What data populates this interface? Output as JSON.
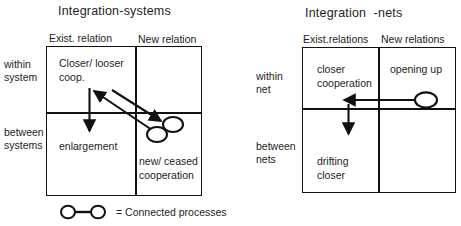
{
  "diagrams": [
    {
      "id": "integration-systems",
      "title": "Integration-systems",
      "columns": [
        "Exist. relation",
        "New relation"
      ],
      "rows": [
        "within\nsystem",
        "between\nsystems"
      ],
      "cells": [
        {
          "row": 0,
          "col": 0,
          "text": "Closer/ looser\ncoop."
        },
        {
          "row": 0,
          "col": 1,
          "text": ""
        },
        {
          "row": 1,
          "col": 0,
          "text": "enlargement"
        },
        {
          "row": 1,
          "col": 1,
          "text": "new/ ceased\ncooperation"
        }
      ]
    },
    {
      "id": "integration-nets",
      "title": "Integration  -nets",
      "columns": [
        "Exist.relations",
        "New relations"
      ],
      "rows": [
        "within\nnet",
        "between\nnets"
      ],
      "cells": [
        {
          "row": 0,
          "col": 0,
          "text": "closer\ncooperation"
        },
        {
          "row": 0,
          "col": 1,
          "text": "opening up"
        },
        {
          "row": 1,
          "col": 0,
          "text": "drifting\ncloser"
        },
        {
          "row": 1,
          "col": 1,
          "text": ""
        }
      ]
    }
  ],
  "legend": {
    "symbol": "connected-processes-symbol",
    "text": "= Connected processes"
  },
  "colors": {
    "stroke": "#111111",
    "text": "#1d1d1d",
    "background": "#ffffff"
  },
  "annotations": {
    "arrows": [
      {
        "name": "arrow-down-enlargement",
        "diagram": "integration-systems"
      },
      {
        "name": "arrow-diagonal-to-closer-coop",
        "diagram": "integration-systems"
      },
      {
        "name": "arrow-diagonal-to-new-ceased",
        "diagram": "integration-systems"
      },
      {
        "name": "arrow-left-opening-up-to-closer",
        "diagram": "integration-nets"
      },
      {
        "name": "arrow-down-drifting-closer",
        "diagram": "integration-nets"
      }
    ],
    "process_nodes": [
      {
        "name": "process-pair-new-ceased",
        "diagram": "integration-systems",
        "count": 2
      },
      {
        "name": "process-node-opening-up",
        "diagram": "integration-nets",
        "count": 1
      }
    ]
  }
}
